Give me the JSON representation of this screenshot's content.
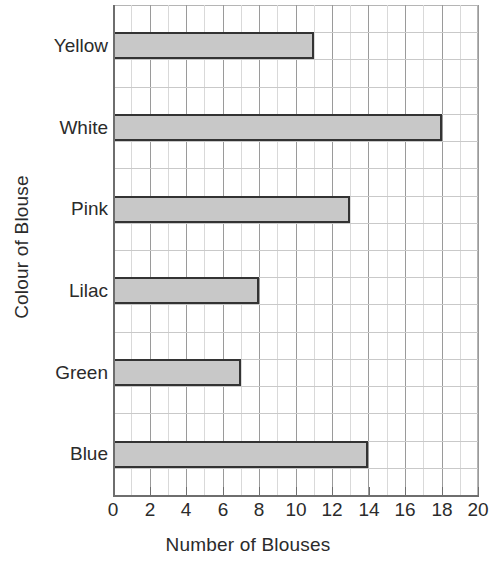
{
  "chart_data": {
    "type": "bar",
    "orientation": "horizontal",
    "title": "",
    "xlabel": "Number of Blouses",
    "ylabel": "Colour of Blouse",
    "categories": [
      "Yellow",
      "White",
      "Pink",
      "Lilac",
      "Green",
      "Blue"
    ],
    "values": [
      11,
      18,
      13,
      8,
      7,
      14
    ],
    "xlim": [
      0,
      20
    ],
    "xticks": [
      0,
      2,
      4,
      6,
      8,
      10,
      12,
      14,
      16,
      18,
      20
    ],
    "xtick_labels": [
      "0",
      "2",
      "4",
      "6",
      "8",
      "10",
      "12",
      "14",
      "16",
      "18",
      "20"
    ],
    "minor_x_step": 1,
    "grid": true,
    "legend": "none",
    "bar_fill_color": "#c8c8c8",
    "bar_edge_color": "#333333",
    "grid_major_color": "#9a9a9a",
    "grid_minor_color": "#d9d9d9",
    "axis_color": "#6e6e6e",
    "text_color": "#2b2b2b",
    "background_color": "#ffffff"
  }
}
